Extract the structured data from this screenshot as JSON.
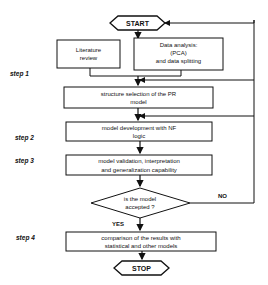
{
  "diagram": {
    "type": "flowchart",
    "nodes": {
      "start": {
        "label": "START",
        "shape": "hexagon"
      },
      "literature": {
        "label_lines": [
          "Literature",
          "review"
        ],
        "shape": "rect"
      },
      "data_analysis": {
        "label_lines": [
          "Data analysis:",
          "(PCA)",
          "and data splitting"
        ],
        "shape": "rect"
      },
      "structure": {
        "label_lines": [
          "structure selection of the PR",
          "model"
        ],
        "shape": "rect"
      },
      "development": {
        "label_lines": [
          "model development with NF",
          "logic"
        ],
        "shape": "rect"
      },
      "validation": {
        "label_lines": [
          "model validation, interpretation",
          "and generalization capability"
        ],
        "shape": "rect"
      },
      "decision": {
        "label_lines": [
          "is the model",
          "accepted ?"
        ],
        "shape": "diamond"
      },
      "comparison": {
        "label_lines": [
          "comparison of the results with",
          "statistical and other models"
        ],
        "shape": "rect"
      },
      "stop": {
        "label": "STOP",
        "shape": "hexagon"
      }
    },
    "edge_labels": {
      "yes": "YES",
      "no": "NO"
    },
    "steps": [
      "step 1",
      "step 2",
      "step 3",
      "step 4"
    ],
    "colors": {
      "line": "#111111",
      "background": "#ffffff"
    }
  }
}
